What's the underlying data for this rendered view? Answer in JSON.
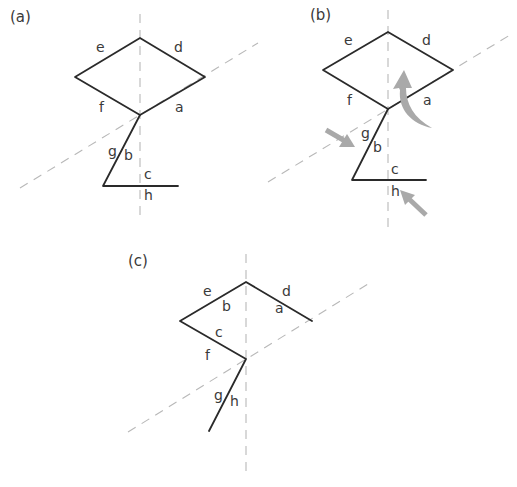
{
  "panels": [
    {
      "id": "a",
      "label": "(a)",
      "edge_labels": {
        "e": "e",
        "d": "d",
        "f": "f",
        "a": "a",
        "g": "g",
        "b": "b",
        "c": "c",
        "h": "h"
      }
    },
    {
      "id": "b",
      "label": "(b)",
      "edge_labels": {
        "e": "e",
        "d": "d",
        "f": "f",
        "a": "a",
        "g": "g",
        "b": "b",
        "c": "c",
        "h": "h"
      },
      "arrows": [
        "curved-up-arrow",
        "push-arrow-upper-left",
        "push-arrow-lower-right"
      ]
    },
    {
      "id": "c",
      "label": "(c)",
      "edge_labels": {
        "e": "e",
        "b": "b",
        "d": "d",
        "a": "a",
        "c": "c",
        "f": "f",
        "g": "g",
        "h": "h"
      }
    }
  ],
  "colors": {
    "line": "#2a2a2a",
    "axis": "#b8b8b8",
    "arrow": "#a9a9a9",
    "text": "#3a3a3a"
  }
}
